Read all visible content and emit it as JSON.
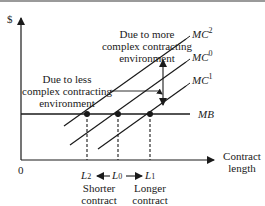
{
  "diagram": {
    "y_axis_label": "$",
    "x_axis_label_line1": "Contract",
    "x_axis_label_line2": "length",
    "origin_label": "0",
    "curves": {
      "mc2": {
        "base": "MC",
        "sup": "2"
      },
      "mc0": {
        "base": "MC",
        "sup": "0"
      },
      "mc1": {
        "base": "MC",
        "sup": "1"
      },
      "mb": {
        "base": "MB"
      }
    },
    "x_ticks": {
      "l2": {
        "base": "L",
        "sub": "2"
      },
      "l0": {
        "base": "L",
        "sub": "0"
      },
      "l1": {
        "base": "L",
        "sub": "1"
      }
    },
    "annotations": {
      "more_complex": [
        "Due to more",
        "complex contracting",
        "environment"
      ],
      "less_complex": [
        "Due to less",
        "complex contracting",
        "environment"
      ],
      "shorter": [
        "Shorter",
        "contract"
      ],
      "longer": [
        "Longer",
        "contract"
      ]
    },
    "colors": {
      "ink": "#1a1a1a",
      "background": "#ffffff"
    }
  }
}
